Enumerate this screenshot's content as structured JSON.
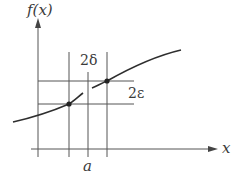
{
  "diagram": {
    "labels": {
      "y_axis": "f(x)",
      "x_axis": "x",
      "point": "a",
      "delta": "2δ",
      "epsilon": "2ε"
    },
    "colors": {
      "line": "#3a3a3a",
      "grid": "#555555",
      "background": "#ffffff"
    },
    "points": [
      {
        "name": "lower",
        "x": 69,
        "y": 104
      },
      {
        "name": "upper",
        "x": 107,
        "y": 81
      }
    ]
  }
}
